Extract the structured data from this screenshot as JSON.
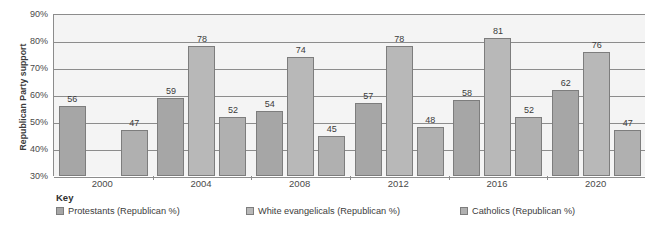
{
  "chart_data": {
    "type": "bar",
    "title": "",
    "subtitle": "",
    "xlabel": "",
    "ylabel": "Republican Party support",
    "categories": [
      "2000",
      "2004",
      "2008",
      "2012",
      "2016",
      "2020"
    ],
    "series": [
      {
        "name": "Protestants (Republican %)",
        "color": "#a6a6a6",
        "values": [
          56,
          59,
          54,
          57,
          58,
          62
        ]
      },
      {
        "name": "White evangelicals (Republican %)",
        "color": "#b8b8b8",
        "values": [
          null,
          78,
          74,
          78,
          81,
          76
        ]
      },
      {
        "name": "Catholics (Republican %)",
        "color": "#b0b0b0",
        "values": [
          47,
          52,
          45,
          48,
          52,
          47
        ]
      }
    ],
    "ylim": [
      30,
      90
    ],
    "ytick_labels": [
      "90%",
      "80%",
      "70%",
      "60%",
      "50%",
      "40%",
      "30%"
    ],
    "ytick_values": [
      90,
      80,
      70,
      60,
      50,
      40,
      30
    ],
    "grid": true,
    "legend_position": "bottom-left",
    "legend_title": "Key",
    "plot_background": "#f4f4f4",
    "axis_color": "#8c8c8c"
  },
  "legend": {
    "title": "Key",
    "items": [
      {
        "label": "Protestants (Republican %)",
        "color": "#a6a6a6"
      },
      {
        "label": "White evangelicals (Republican %)",
        "color": "#b8b8b8"
      },
      {
        "label": "Catholics (Republican %)",
        "color": "#b0b0b0"
      }
    ]
  },
  "footer": {
    "note": ""
  }
}
